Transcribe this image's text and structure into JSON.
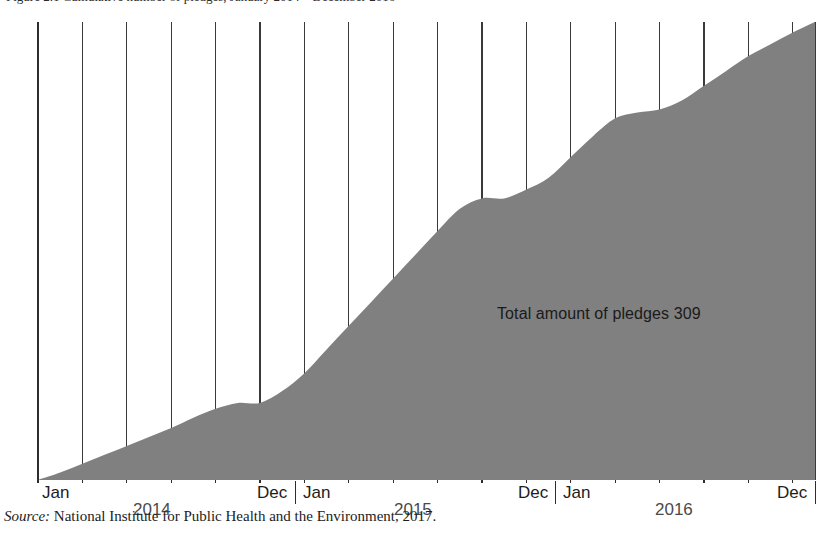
{
  "figure": {
    "title_clipped": "Figure 2.1  Cumulative number of pledges, January 2014 – December 2016",
    "annotation": "Total amount of pledges 309",
    "source_prefix": "Source:",
    "source_text": "National Institute for Public Health and the Environment, 2017."
  },
  "axis": {
    "month_labels": [
      {
        "text": "Jan",
        "x": 42
      },
      {
        "text": "Dec",
        "x": 257
      },
      {
        "text": "Jan",
        "x": 303
      },
      {
        "text": "Dec",
        "x": 518
      },
      {
        "text": "Jan",
        "x": 563
      },
      {
        "text": "Dec",
        "x": 777
      }
    ],
    "year_labels": [
      {
        "text": "2014",
        "x": 133
      },
      {
        "text": "2015",
        "x": 394
      },
      {
        "text": "2016",
        "x": 655
      }
    ],
    "separators": [
      295,
      555,
      815
    ]
  },
  "style": {
    "area_fill": "#808080",
    "gridline_color": "#3a3a3a",
    "axis_color": "#2d2d2d",
    "text_color": "#1d1d1d"
  },
  "chart_data": {
    "type": "area",
    "title": "Cumulative number of pledges",
    "xlabel": "",
    "ylabel": "Cumulative pledges",
    "grid": true,
    "legend": "none",
    "annotation": "Total amount of pledges 309",
    "xlim": [
      "2014-01",
      "2016-12"
    ],
    "ylim": [
      0,
      309
    ],
    "final_value": 309,
    "x": [
      "2014-01",
      "2014-02",
      "2014-03",
      "2014-04",
      "2014-05",
      "2014-06",
      "2014-07",
      "2014-08",
      "2014-09",
      "2014-10",
      "2014-11",
      "2014-12",
      "2015-01",
      "2015-02",
      "2015-03",
      "2015-04",
      "2015-05",
      "2015-06",
      "2015-07",
      "2015-08",
      "2015-09",
      "2015-10",
      "2015-11",
      "2015-12",
      "2016-01",
      "2016-02",
      "2016-03",
      "2016-04",
      "2016-05",
      "2016-06",
      "2016-07",
      "2016-08",
      "2016-09",
      "2016-10",
      "2016-11",
      "2016-12"
    ],
    "values": [
      0,
      5,
      11,
      17,
      23,
      29,
      35,
      42,
      48,
      52,
      52,
      60,
      72,
      88,
      104,
      120,
      136,
      152,
      168,
      183,
      190,
      190,
      196,
      204,
      218,
      232,
      244,
      248,
      250,
      256,
      266,
      276,
      286,
      294,
      302,
      309
    ],
    "gridline_months": [
      "2014-01",
      "2014-03",
      "2014-05",
      "2014-07",
      "2014-09",
      "2014-11",
      "2015-01",
      "2015-03",
      "2015-05",
      "2015-07",
      "2015-09",
      "2015-11",
      "2016-01",
      "2016-03",
      "2016-05",
      "2016-07",
      "2016-09",
      "2016-11",
      "2016-12"
    ]
  }
}
